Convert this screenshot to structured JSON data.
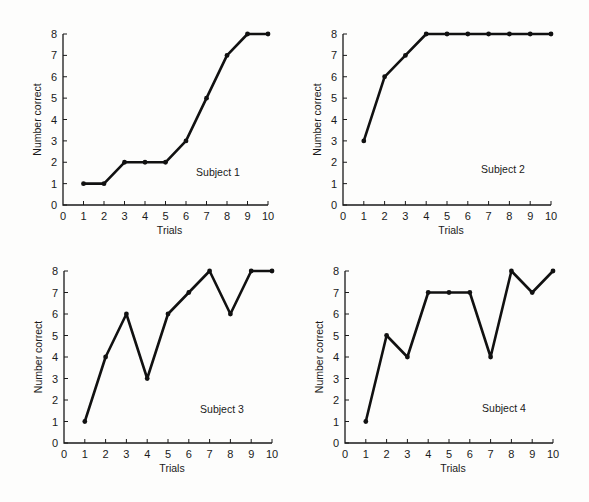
{
  "figure": {
    "panels": [
      {
        "id": "subject-1",
        "label": "Subject 1"
      },
      {
        "id": "subject-2",
        "label": "Subject 2"
      },
      {
        "id": "subject-3",
        "label": "Subject 3"
      },
      {
        "id": "subject-4",
        "label": "Subject 4"
      }
    ],
    "xlabel": "Trials",
    "ylabel": "Number correct"
  },
  "chart_data": [
    {
      "type": "line",
      "title": "Subject 1",
      "xlabel": "Trials",
      "ylabel": "Number correct",
      "x": [
        1,
        2,
        3,
        4,
        5,
        6,
        7,
        8,
        9,
        10
      ],
      "values": [
        1,
        1,
        2,
        2,
        2,
        3,
        5,
        7,
        8,
        8
      ],
      "xticks": [
        0,
        1,
        2,
        3,
        4,
        5,
        6,
        7,
        8,
        9,
        10
      ],
      "yticks": [
        0,
        1,
        2,
        3,
        4,
        5,
        6,
        7,
        8
      ],
      "xlim": [
        0,
        10
      ],
      "ylim": [
        0,
        8
      ],
      "grid": false,
      "annotation": "Subject 1"
    },
    {
      "type": "line",
      "title": "Subject 2",
      "xlabel": "Trials",
      "ylabel": "Number correct",
      "x": [
        1,
        2,
        3,
        4,
        5,
        6,
        7,
        8,
        9,
        10
      ],
      "values": [
        3,
        6,
        7,
        8,
        8,
        8,
        8,
        8,
        8,
        8
      ],
      "xticks": [
        0,
        1,
        2,
        3,
        4,
        5,
        6,
        7,
        8,
        9,
        10
      ],
      "yticks": [
        0,
        1,
        2,
        3,
        4,
        5,
        6,
        7,
        8
      ],
      "xlim": [
        0,
        10
      ],
      "ylim": [
        0,
        8
      ],
      "grid": false,
      "annotation": "Subject 2"
    },
    {
      "type": "line",
      "title": "Subject 3",
      "xlabel": "Trials",
      "ylabel": "Number correct",
      "x": [
        1,
        2,
        3,
        4,
        5,
        6,
        7,
        8,
        9,
        10
      ],
      "values": [
        1,
        4,
        6,
        3,
        6,
        7,
        8,
        6,
        8,
        8
      ],
      "xticks": [
        0,
        1,
        2,
        3,
        4,
        5,
        6,
        7,
        8,
        9,
        10
      ],
      "yticks": [
        0,
        1,
        2,
        3,
        4,
        5,
        6,
        7,
        8
      ],
      "xlim": [
        0,
        10
      ],
      "ylim": [
        0,
        8
      ],
      "grid": false,
      "annotation": "Subject 3"
    },
    {
      "type": "line",
      "title": "Subject 4",
      "xlabel": "Trials",
      "ylabel": "Number correct",
      "x": [
        1,
        2,
        3,
        4,
        5,
        6,
        7,
        8,
        9,
        10
      ],
      "values": [
        1,
        5,
        4,
        7,
        7,
        7,
        4,
        8,
        7,
        8
      ],
      "xticks": [
        0,
        1,
        2,
        3,
        4,
        5,
        6,
        7,
        8,
        9,
        10
      ],
      "yticks": [
        0,
        1,
        2,
        3,
        4,
        5,
        6,
        7,
        8
      ],
      "xlim": [
        0,
        10
      ],
      "ylim": [
        0,
        8
      ],
      "grid": false,
      "annotation": "Subject 4"
    }
  ],
  "layout": {
    "panels": [
      {
        "x0": 63,
        "x10": 268,
        "y0": 205,
        "y8": 34
      },
      {
        "x0": 343,
        "x10": 551,
        "y0": 205,
        "y8": 34
      },
      {
        "x0": 64,
        "x10": 272,
        "y0": 443,
        "y8": 271
      },
      {
        "x0": 345,
        "x10": 553,
        "y0": 443,
        "y8": 271
      }
    ],
    "subject_label_pos": [
      {
        "x": 218,
        "y": 176
      },
      {
        "x": 503,
        "y": 173
      },
      {
        "x": 222,
        "y": 413
      },
      {
        "x": 504,
        "y": 412
      }
    ]
  }
}
